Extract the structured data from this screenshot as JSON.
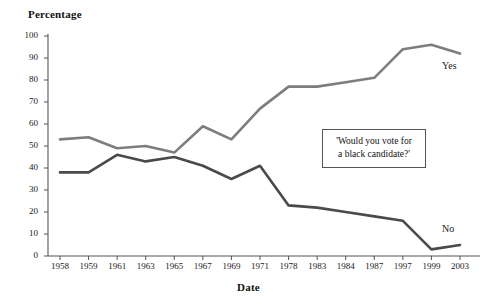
{
  "chart_data": {
    "type": "line",
    "title": "",
    "xlabel": "Date",
    "ylabel": "Percentage",
    "ylim": [
      0,
      100
    ],
    "y_ticks": [
      0,
      10,
      20,
      30,
      40,
      50,
      60,
      70,
      80,
      90,
      100
    ],
    "grid": false,
    "legend_position": "inline-right-end-of-line",
    "categories": [
      "1958",
      "1959",
      "1961",
      "1963",
      "1965",
      "1967",
      "1969",
      "1971",
      "1978",
      "1983",
      "1984",
      "1987",
      "1997",
      "1999",
      "2003"
    ],
    "x": [
      "1958",
      "1959",
      "1961",
      "1963",
      "1965",
      "1967",
      "1969",
      "1971",
      "1978",
      "1983",
      "1984",
      "1987",
      "1997",
      "1999",
      "2003"
    ],
    "series": [
      {
        "name": "Yes",
        "color": "#7d7d7d",
        "values": [
          53,
          54,
          49,
          50,
          47,
          59,
          53,
          67,
          77,
          77,
          79,
          81,
          94,
          96,
          92
        ]
      },
      {
        "name": "No",
        "color": "#4a4a4a",
        "values": [
          38,
          38,
          46,
          43,
          45,
          41,
          35,
          41,
          23,
          22,
          20,
          18,
          16,
          3,
          5
        ]
      }
    ],
    "annotations": [
      {
        "name": "poll-question",
        "lines": [
          "'Would you vote for",
          "a black candidate?'"
        ]
      }
    ]
  },
  "axes": {
    "y_title": "Percentage",
    "x_title": "Date",
    "y_tick_labels": [
      "100",
      "90",
      "80",
      "70",
      "60",
      "50",
      "40",
      "30",
      "20",
      "10",
      "0"
    ],
    "x_tick_labels": [
      "1958",
      "1959",
      "1961",
      "1963",
      "1965",
      "1967",
      "1969",
      "1971",
      "1978",
      "1983",
      "1984",
      "1987",
      "1997",
      "1999",
      "2003"
    ]
  },
  "series_labels": {
    "yes": "Yes",
    "no": "No"
  },
  "annotation": {
    "line1": "'Would you vote for",
    "line2": "a black candidate?'"
  },
  "colors": {
    "yes_line": "#7d7d7d",
    "no_line": "#4a4a4a",
    "axis": "#555555",
    "text": "#1a1a1a"
  }
}
